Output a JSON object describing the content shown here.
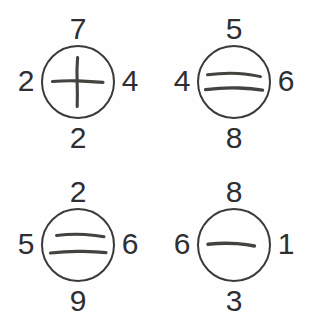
{
  "diagram": {
    "background_color": "#fefefe",
    "ink_color": "#3a3a3c",
    "circle_count": 4,
    "cells": [
      {
        "position": "top-left",
        "mark": "cross-mark",
        "mark_description": "plus sign / cross",
        "stroke_count": 2,
        "numbers": {
          "top": "7",
          "left": "2",
          "right": "4",
          "bottom": "2"
        }
      },
      {
        "position": "top-right",
        "mark": "equals-mark",
        "mark_description": "two horizontal lines",
        "stroke_count": 2,
        "numbers": {
          "top": "5",
          "left": "4",
          "right": "6",
          "bottom": "8"
        }
      },
      {
        "position": "bottom-left",
        "mark": "equals-mark",
        "mark_description": "two horizontal lines",
        "stroke_count": 2,
        "numbers": {
          "top": "2",
          "left": "5",
          "right": "6",
          "bottom": "9"
        }
      },
      {
        "position": "bottom-right",
        "mark": "dash-mark",
        "mark_description": "single horizontal line",
        "stroke_count": 1,
        "numbers": {
          "top": "8",
          "left": "6",
          "right": "1",
          "bottom": "3"
        }
      }
    ]
  }
}
